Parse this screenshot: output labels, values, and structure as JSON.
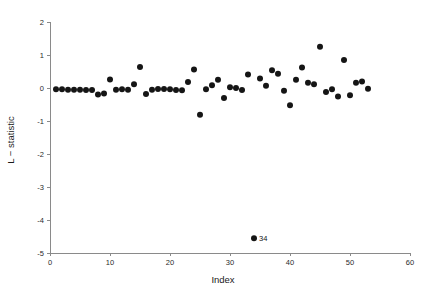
{
  "chart_data": {
    "type": "scatter",
    "title": "",
    "xlabel": "Index",
    "ylabel": "L − statistic",
    "xlim": [
      0,
      60
    ],
    "ylim": [
      -5,
      2
    ],
    "xticks": [
      0,
      10,
      20,
      30,
      40,
      50,
      60
    ],
    "xtick_labels": [
      "0",
      "10",
      "20",
      "30",
      "40",
      "50",
      "60"
    ],
    "yticks": [
      2,
      1,
      0,
      -1,
      -2,
      -3,
      -4,
      -5
    ],
    "ytick_labels": [
      "2",
      "1",
      "0",
      "-1",
      "-2",
      "-3",
      "-4",
      "-5"
    ],
    "grid": false,
    "legend": null,
    "marker": "filled-circle",
    "marker_color": "#151515",
    "marker_size": 3.0,
    "x": [
      1,
      2,
      3,
      4,
      5,
      6,
      7,
      8,
      9,
      10,
      11,
      12,
      13,
      14,
      15,
      16,
      17,
      18,
      19,
      20,
      21,
      22,
      23,
      24,
      25,
      26,
      27,
      28,
      29,
      30,
      31,
      32,
      33,
      34,
      35,
      36,
      37,
      38,
      39,
      40,
      41,
      42,
      43,
      44,
      45,
      46,
      47,
      48,
      49,
      50,
      51,
      52,
      53
    ],
    "y": [
      -0.04,
      -0.04,
      -0.05,
      -0.05,
      -0.05,
      -0.06,
      -0.06,
      -0.2,
      -0.17,
      0.26,
      -0.05,
      -0.04,
      -0.05,
      0.11,
      0.64,
      -0.18,
      -0.05,
      -0.03,
      -0.03,
      -0.04,
      -0.06,
      -0.07,
      0.18,
      0.56,
      -0.81,
      -0.04,
      0.08,
      0.25,
      -0.3,
      0.02,
      0.0,
      -0.06,
      0.41,
      -4.55,
      0.29,
      0.07,
      0.54,
      0.43,
      -0.08,
      -0.52,
      0.25,
      0.62,
      0.16,
      0.11,
      1.25,
      -0.12,
      -0.04,
      -0.26,
      0.85,
      -0.22,
      0.16,
      0.2,
      -0.02
    ],
    "annotations": [
      {
        "text": "34",
        "x": 34,
        "y": -4.55,
        "position": "right"
      }
    ]
  }
}
